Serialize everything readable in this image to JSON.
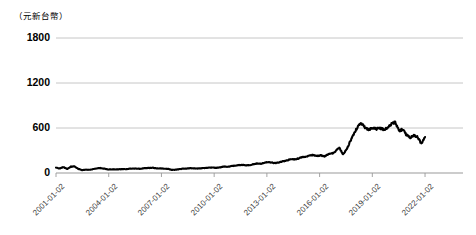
{
  "chart_data": {
    "type": "line",
    "title": "",
    "subtitle": "",
    "unit_label": "（元新台幣）",
    "xlabel": "",
    "ylabel": "",
    "ylim": [
      0,
      1800
    ],
    "y_ticks": [
      0,
      600,
      1200,
      1800
    ],
    "y_tick_labels": [
      "0",
      "600",
      "1200",
      "1800"
    ],
    "x_tick_labels": [
      "2001-01-02",
      "2004-01-02",
      "2007-01-02",
      "2010-01-02",
      "2013-01-02",
      "2016-01-02",
      "2019-01-02",
      "2022-01-02"
    ],
    "grid": true,
    "legend": "none",
    "line_color": "#000000",
    "grid_color": "#bfbfbf",
    "background": "#ffffff",
    "series": [
      {
        "name": "股價",
        "x": [
          "2001-01-02",
          "2001-04-02",
          "2001-07-02",
          "2001-10-01",
          "2002-01-02",
          "2002-04-01",
          "2002-07-01",
          "2002-10-01",
          "2003-01-02",
          "2003-04-01",
          "2003-07-01",
          "2003-10-01",
          "2004-01-02",
          "2004-04-01",
          "2004-07-01",
          "2004-10-01",
          "2005-01-03",
          "2005-04-01",
          "2005-07-01",
          "2005-10-03",
          "2006-01-02",
          "2006-04-03",
          "2006-07-03",
          "2006-10-02",
          "2007-01-02",
          "2007-04-02",
          "2007-07-02",
          "2007-10-01",
          "2008-01-02",
          "2008-04-01",
          "2008-07-01",
          "2008-10-01",
          "2009-01-05",
          "2009-04-01",
          "2009-07-01",
          "2009-10-01",
          "2010-01-04",
          "2010-04-01",
          "2010-07-01",
          "2010-10-01",
          "2011-01-03",
          "2011-04-01",
          "2011-07-01",
          "2011-10-03",
          "2012-01-02",
          "2012-04-02",
          "2012-07-02",
          "2012-10-01",
          "2013-01-02",
          "2013-04-01",
          "2013-07-01",
          "2013-10-01",
          "2014-01-02",
          "2014-04-01",
          "2014-07-01",
          "2014-10-01",
          "2015-01-05",
          "2015-04-01",
          "2015-07-01",
          "2015-10-01",
          "2016-01-04",
          "2016-04-01",
          "2016-07-01",
          "2016-10-03",
          "2017-01-03",
          "2017-04-05",
          "2017-07-03",
          "2017-10-02",
          "2018-01-02",
          "2018-04-02",
          "2018-07-02",
          "2018-10-01",
          "2019-01-02",
          "2019-04-01",
          "2019-07-01",
          "2019-10-01",
          "2020-01-02",
          "2020-03-19",
          "2020-07-01",
          "2020-10-05",
          "2020-12-01",
          "2021-01-21",
          "2021-02-18",
          "2021-03-15",
          "2021-04-26",
          "2021-06-01",
          "2021-07-01",
          "2021-08-20",
          "2021-10-05",
          "2021-11-15",
          "2022-01-02",
          "2022-01-17",
          "2022-03-08",
          "2022-04-01",
          "2022-05-12",
          "2022-06-20",
          "2022-08-01",
          "2022-09-15",
          "2022-10-25",
          "2022-12-01"
        ],
        "values": [
          72,
          60,
          78,
          52,
          85,
          88,
          55,
          38,
          45,
          42,
          52,
          62,
          65,
          58,
          46,
          48,
          48,
          50,
          52,
          52,
          58,
          60,
          56,
          58,
          65,
          68,
          70,
          62,
          62,
          58,
          56,
          42,
          44,
          50,
          58,
          60,
          64,
          62,
          60,
          62,
          68,
          72,
          74,
          68,
          76,
          86,
          82,
          92,
          98,
          104,
          108,
          104,
          106,
          118,
          126,
          124,
          138,
          146,
          138,
          132,
          142,
          158,
          168,
          186,
          182,
          192,
          212,
          218,
          232,
          240,
          228,
          236,
          222,
          248,
          258,
          290,
          338,
          248,
          320,
          430,
          530,
          625,
          660,
          600,
          580,
          600,
          590,
          600,
          580,
          600,
          655,
          680,
          560,
          580,
          510,
          470,
          500,
          480,
          390,
          480
        ]
      }
    ],
    "annotations": []
  }
}
